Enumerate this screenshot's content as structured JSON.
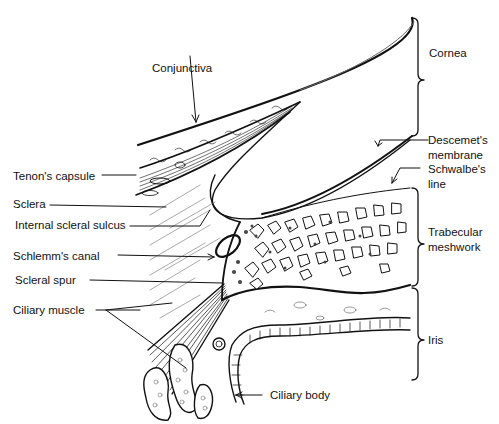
{
  "figure": {
    "line_color": "#111111",
    "background": "#ffffff"
  },
  "labels": {
    "conjunctiva": "Conjunctiva",
    "tenons_capsule": "Tenon's capsule",
    "sclera": "Sclera",
    "internal_scleral_sulcus": "Internal scleral sulcus",
    "schlemms_canal": "Schlemm's canal",
    "scleral_spur": "Scleral spur",
    "ciliary_muscle": "Ciliary muscle",
    "cornea": "Cornea",
    "descemets_membrane": "Descemet's membrane",
    "schwalbes_line": "Schwalbe's line",
    "trabecular_meshwork": "Trabecular meshwork",
    "iris": "Iris",
    "ciliary_body": "Ciliary body"
  }
}
